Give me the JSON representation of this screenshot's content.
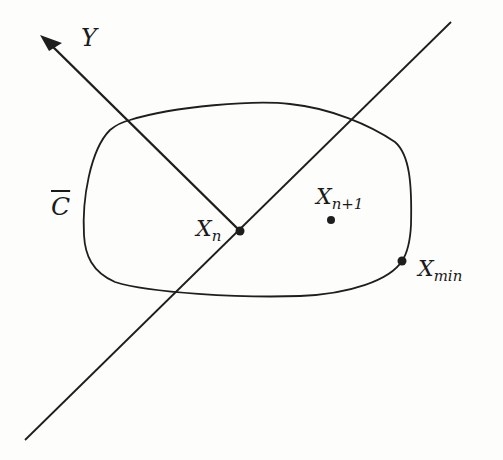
{
  "diagram": {
    "colors": {
      "stroke": "#1e1e1e",
      "background": "#fdfdfc"
    },
    "labels": {
      "y_axis": "Y",
      "region": "C",
      "x_n_main": "X",
      "x_n_sub": "n",
      "x_n1_main": "X",
      "x_n1_sub": "n+1",
      "x_min_main": "X",
      "x_min_sub": "min"
    },
    "points": [
      {
        "name": "X_n",
        "x": 240,
        "y": 231
      },
      {
        "name": "X_n+1",
        "x": 331,
        "y": 220
      },
      {
        "name": "X_min",
        "x": 402,
        "y": 261
      }
    ],
    "arrow": {
      "from": [
        240,
        231
      ],
      "to": [
        42,
        36
      ]
    },
    "line": {
      "from": [
        25,
        440
      ],
      "to": [
        451,
        22
      ]
    }
  }
}
